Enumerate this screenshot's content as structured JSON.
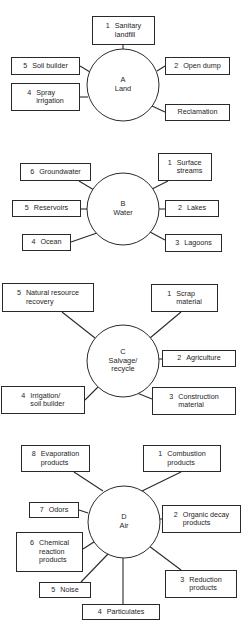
{
  "diagram": {
    "title": "",
    "colors": {
      "line": "#2a2a2a",
      "text": "#1e1e1e",
      "background": "#ffffff"
    },
    "sections": [
      {
        "id": "A",
        "hub": {
          "letter": "A",
          "label": "Land",
          "cx": 123,
          "cy": 85,
          "r": 36
        },
        "nodes": [
          {
            "num": "1",
            "label": "Sanitary\nlandfill",
            "x": 92,
            "y": 16,
            "w": 63,
            "h": 29,
            "lx1": 123,
            "ly1": 45,
            "lx2": 123,
            "ly2": 49
          },
          {
            "num": "2",
            "label": "Open dump",
            "x": 165,
            "y": 57,
            "w": 65,
            "h": 18,
            "lx1": 165,
            "ly1": 66,
            "lx2": 157,
            "ly2": 71
          },
          {
            "num": "",
            "label": "Reclamation",
            "x": 165,
            "y": 104,
            "w": 65,
            "h": 17,
            "lx1": 165,
            "ly1": 112,
            "lx2": 152,
            "ly2": 106
          },
          {
            "num": "4",
            "label": "Spray\nirrigation",
            "x": 11,
            "y": 83,
            "w": 69,
            "h": 28,
            "lx1": 80,
            "ly1": 97,
            "lx2": 88,
            "ly2": 97
          },
          {
            "num": "5",
            "label": "Soil builder",
            "x": 11,
            "y": 57,
            "w": 69,
            "h": 18,
            "lx1": 80,
            "ly1": 66,
            "lx2": 90,
            "ly2": 72
          }
        ]
      },
      {
        "id": "B",
        "hub": {
          "letter": "B",
          "label": "Water",
          "cx": 123,
          "cy": 209,
          "r": 36
        },
        "nodes": [
          {
            "num": "1",
            "label": "Surface\nstreams",
            "x": 158,
            "y": 153,
            "w": 54,
            "h": 28,
            "lx1": 168,
            "ly1": 181,
            "lx2": 152,
            "ly2": 189
          },
          {
            "num": "2",
            "label": "Lakes",
            "x": 165,
            "y": 200,
            "w": 54,
            "h": 17,
            "lx1": 165,
            "ly1": 209,
            "lx2": 159,
            "ly2": 209
          },
          {
            "num": "3",
            "label": "Lagoons",
            "x": 165,
            "y": 234,
            "w": 57,
            "h": 18,
            "lx1": 165,
            "ly1": 240,
            "lx2": 150,
            "ly2": 232
          },
          {
            "num": "4",
            "label": "Ocean",
            "x": 22,
            "y": 234,
            "w": 49,
            "h": 17,
            "lx1": 71,
            "ly1": 242,
            "lx2": 97,
            "ly2": 233
          },
          {
            "num": "5",
            "label": "Reservoirs",
            "x": 12,
            "y": 200,
            "w": 69,
            "h": 17,
            "lx1": 81,
            "ly1": 209,
            "lx2": 87,
            "ly2": 209
          },
          {
            "num": "6",
            "label": "Groundwater",
            "x": 20,
            "y": 163,
            "w": 71,
            "h": 18,
            "lx1": 79,
            "ly1": 181,
            "lx2": 94,
            "ly2": 190
          }
        ]
      },
      {
        "id": "C",
        "hub": {
          "letter": "C",
          "label": "Salvage/\nrecycle",
          "cx": 123,
          "cy": 361,
          "r": 36
        },
        "nodes": [
          {
            "num": "1",
            "label": "Scrap\nmaterial",
            "x": 151,
            "y": 284,
            "w": 67,
            "h": 28,
            "lx1": 181,
            "ly1": 312,
            "lx2": 150,
            "ly2": 338
          },
          {
            "num": "2",
            "label": "Agriculture",
            "x": 162,
            "y": 350,
            "w": 74,
            "h": 17,
            "lx1": 162,
            "ly1": 359,
            "lx2": 159,
            "ly2": 359
          },
          {
            "num": "3",
            "label": "Construction\nmaterial",
            "x": 152,
            "y": 387,
            "w": 84,
            "h": 28,
            "lx1": 152,
            "ly1": 399,
            "lx2": 137,
            "ly2": 393
          },
          {
            "num": "4",
            "label": "Irrigation/\nsoil builder",
            "x": 1,
            "y": 386,
            "w": 84,
            "h": 28,
            "lx1": 85,
            "ly1": 400,
            "lx2": 98,
            "ly2": 387
          },
          {
            "num": "5",
            "label": "Natural resource\nrecovery",
            "x": 2,
            "y": 283,
            "w": 92,
            "h": 29,
            "lx1": 62,
            "ly1": 312,
            "lx2": 95,
            "ly2": 338
          }
        ]
      },
      {
        "id": "D",
        "hub": {
          "letter": "D",
          "label": "Air",
          "cx": 124,
          "cy": 522,
          "r": 36
        },
        "nodes": [
          {
            "num": "1",
            "label": "Combustion\nproducts",
            "x": 143,
            "y": 445,
            "w": 78,
            "h": 27,
            "lx1": 181,
            "ly1": 472,
            "lx2": 142,
            "ly2": 491
          },
          {
            "num": "2",
            "label": "Organic decay\nproducts",
            "x": 162,
            "y": 505,
            "w": 79,
            "h": 28,
            "lx1": 162,
            "ly1": 519,
            "lx2": 160,
            "ly2": 519
          },
          {
            "num": "3",
            "label": "Reduction\nproducts",
            "x": 165,
            "y": 570,
            "w": 72,
            "h": 28,
            "lx1": 181,
            "ly1": 570,
            "lx2": 149,
            "ly2": 546
          },
          {
            "num": "4",
            "label": "Particulates",
            "x": 82,
            "y": 604,
            "w": 78,
            "h": 16,
            "lx1": 123,
            "ly1": 604,
            "lx2": 123,
            "ly2": 558
          },
          {
            "num": "5",
            "label": "Noise",
            "x": 39,
            "y": 582,
            "w": 52,
            "h": 16,
            "lx1": 81,
            "ly1": 582,
            "lx2": 108,
            "ly2": 554
          },
          {
            "num": "6",
            "label": "Chemical\nreaction\nproducts",
            "x": 16,
            "y": 532,
            "w": 67,
            "h": 40,
            "lx1": 83,
            "ly1": 549,
            "lx2": 97,
            "ly2": 540
          },
          {
            "num": "7",
            "label": "Odors",
            "x": 29,
            "y": 502,
            "w": 50,
            "h": 16,
            "lx1": 79,
            "ly1": 510,
            "lx2": 88,
            "ly2": 513
          },
          {
            "num": "8",
            "label": "Evaporation\nproducts",
            "x": 21,
            "y": 445,
            "w": 69,
            "h": 27,
            "lx1": 74,
            "ly1": 472,
            "lx2": 103,
            "ly2": 491
          }
        ]
      }
    ]
  }
}
